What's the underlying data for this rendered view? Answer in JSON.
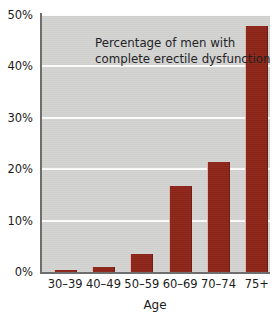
{
  "chart_data": {
    "type": "bar",
    "title_lines": [
      "Percentage of men with",
      "complete erectile dysfunction"
    ],
    "xlabel": "Age",
    "ylabel": "",
    "categories": [
      "30–39",
      "40–49",
      "50–59",
      "60–69",
      "70–74",
      "75+"
    ],
    "values": [
      0.4,
      1.0,
      3.6,
      16.8,
      21.5,
      47.8
    ],
    "ylim": [
      0,
      50
    ],
    "ytick_labels": [
      "0%",
      "10%",
      "20%",
      "30%",
      "40%",
      "50%"
    ],
    "ytick_values": [
      0,
      10,
      20,
      30,
      40,
      50
    ],
    "grid": true,
    "legend": "none",
    "bar_color": "#8c2418",
    "plot_background": "#d3d3d1",
    "gridline_color": "#fdfdfd",
    "axis_color": "#6e6e6e",
    "text_color": "#1b1b1b"
  }
}
